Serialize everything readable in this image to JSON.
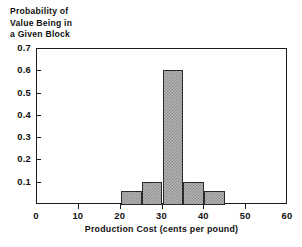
{
  "chart_data": {
    "type": "bar",
    "title": "",
    "xlabel": "Production Cost (cents per pound)",
    "ylabel": "Probability of\nValue Being in\na Given Block",
    "xlim": [
      0,
      60
    ],
    "ylim": [
      0,
      0.7
    ],
    "grid": false,
    "legend": null,
    "bin_width": 5,
    "bin_edges": [
      20,
      25,
      30,
      35,
      40,
      45
    ],
    "categories": [
      "20-25",
      "25-30",
      "30-35",
      "35-40",
      "40-45"
    ],
    "values": [
      0.065,
      0.105,
      0.605,
      0.105,
      0.065
    ],
    "xticks": [
      0,
      10,
      20,
      30,
      40,
      50,
      60
    ],
    "xtick_labels": [
      "0",
      "10",
      "20",
      "30",
      "40",
      "50",
      "60"
    ],
    "yticks": [
      0.1,
      0.2,
      0.3,
      0.4,
      0.5,
      0.6,
      0.7
    ],
    "ytick_labels": [
      "0.1",
      "0.2",
      "0.3",
      "0.4",
      "0.5",
      "0.6",
      "0.7"
    ],
    "bar_fill_color": "#b4b4b4",
    "bar_edge_color": "#2b2b2b",
    "axis_color": "#1a1a1a",
    "background_color": "#ffffff"
  },
  "axes": {
    "y_title": "Probability of\nValue Being in\na Given Block",
    "x_title": "Production Cost (cents per pound)"
  }
}
